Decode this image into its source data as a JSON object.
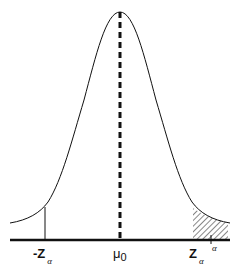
{
  "diagram": {
    "type": "normal-distribution-one-tailed-test",
    "colors": {
      "stroke": "#111111",
      "background": "#ffffff"
    },
    "labels": {
      "neg_critical": {
        "main": "-Z",
        "sub": "α"
      },
      "mean": {
        "main": "μ",
        "sub": "0"
      },
      "pos_critical": {
        "main": "Z",
        "sub": "α"
      },
      "shaded_area": "α"
    }
  }
}
